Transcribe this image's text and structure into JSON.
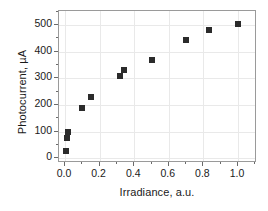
{
  "chart_data": {
    "type": "scatter",
    "title": "",
    "xlabel": "Irradiance, a.u.",
    "ylabel": "Photocurrent, µA",
    "xlim": [
      -0.035,
      1.11
    ],
    "ylim": [
      -18,
      552
    ],
    "grid": true,
    "legend": null,
    "marker": "filled-square",
    "marker_color": "#2b2b2b",
    "xticks": [
      0.0,
      0.2,
      0.4,
      0.6,
      0.8,
      1.0
    ],
    "xticklabels": [
      "0.0",
      "0.2",
      "0.4",
      "0.6",
      "0.8",
      "1.0"
    ],
    "xminorticks": [
      0.1,
      0.3,
      0.5,
      0.7,
      0.9,
      1.1
    ],
    "yticks": [
      0,
      100,
      200,
      300,
      400,
      500
    ],
    "yticklabels": [
      "0",
      "100",
      "200",
      "300",
      "400",
      "500"
    ],
    "yminorticks": [
      50,
      150,
      250,
      350,
      450,
      550
    ],
    "series": [
      {
        "name": "Photocurrent",
        "x": [
          0.005,
          0.012,
          0.015,
          0.1,
          0.15,
          0.315,
          0.34,
          0.5,
          0.7,
          0.83,
          1.0
        ],
        "y": [
          28,
          75,
          100,
          189,
          230,
          310,
          330,
          370,
          443,
          482,
          505
        ]
      }
    ]
  }
}
